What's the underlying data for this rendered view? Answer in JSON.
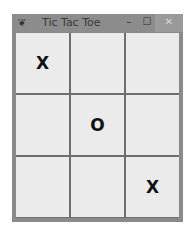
{
  "window": {
    "title": "Tic Tac Toe",
    "icon": "feather-icon",
    "controls": {
      "minimize": "–",
      "maximize": "☐",
      "close": "✕"
    }
  },
  "board": {
    "cells": [
      "X",
      "",
      "",
      "",
      "O",
      "",
      "",
      "",
      "X"
    ]
  }
}
